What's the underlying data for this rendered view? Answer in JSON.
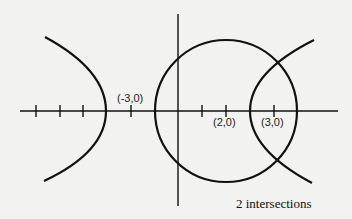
{
  "diagram": {
    "title": "",
    "stroke_color": "#111111",
    "background_color": "#f2f2f0",
    "x_axis": {
      "y": 111,
      "x_start": 20,
      "x_end": 338,
      "ticks_x": [
        36,
        60,
        83,
        131,
        202,
        226,
        274
      ]
    },
    "y_axis": {
      "x": 178,
      "y_start": 14,
      "y_end": 206
    },
    "labels": [
      {
        "text": "(-3,0)",
        "x": 117,
        "y": 93
      },
      {
        "text": "(2,0)",
        "x": 213,
        "y": 117
      },
      {
        "text": "(3,0)",
        "x": 261,
        "y": 117
      }
    ],
    "shapes": {
      "circle": {
        "cx": 226,
        "cy": 111,
        "r": 71,
        "center_label": "(2,0)"
      },
      "hyperbola_left_branch": {
        "vertex_x": 106,
        "top_end": [
          45,
          37
        ],
        "bottom_end": [
          44,
          181
        ]
      },
      "hyperbola_right_branch": {
        "vertex_x": 250,
        "top_end": [
          314,
          40
        ],
        "bottom_end": [
          312,
          183
        ]
      }
    },
    "caption": "2 intersections"
  }
}
